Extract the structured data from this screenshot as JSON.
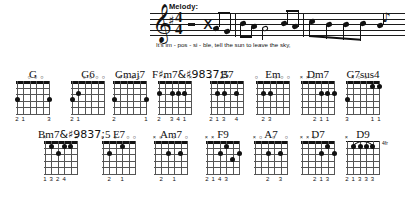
{
  "melody": {
    "label": "Melody:",
    "clef": "treble-clef",
    "key_signature": "one sharp (G major)",
    "time_signature": {
      "top": "4",
      "bottom": "4"
    },
    "lyrics": "It's im - pos - si - ble,   tell the  sun  to leave the sky,",
    "lyric_syllables": [
      "It's",
      "im",
      "-",
      "pos",
      "-",
      "si",
      "-",
      "ble,",
      "tell",
      "the",
      "sun",
      "to",
      "leave",
      "the",
      "sky,"
    ]
  },
  "chords": {
    "rows": [
      [
        {
          "name": "G",
          "markers": [
            "",
            "",
            "o",
            "o",
            "o",
            ""
          ],
          "fingers": [
            "2",
            "1",
            "",
            "",
            "",
            "3"
          ],
          "dots": [
            {
              "s": 0,
              "f": 2
            },
            {
              "s": 5,
              "f": 2
            }
          ]
        },
        {
          "name": "G6",
          "markers": [
            "",
            "",
            "o",
            "o",
            "o",
            "o"
          ],
          "fingers": [
            "2",
            "1",
            "",
            "",
            "",
            ""
          ],
          "dots": [
            {
              "s": 0,
              "f": 2
            },
            {
              "s": 1,
              "f": 1
            }
          ]
        },
        {
          "name": "Gmaj7",
          "markers": [
            "",
            "x",
            "o",
            "o",
            "o",
            ""
          ],
          "fingers": [
            "2",
            "",
            "",
            "",
            "",
            "1"
          ],
          "dots": [
            {
              "s": 0,
              "f": 2
            },
            {
              "s": 5,
              "f": 2
            }
          ]
        },
        {
          "name": "F#m7b5",
          "markers": [
            "",
            "x",
            "",
            "",
            "",
            "x"
          ],
          "fingers": [
            "2",
            "",
            "3",
            "4",
            "1",
            ""
          ],
          "dots": [
            {
              "s": 0,
              "f": 1
            },
            {
              "s": 2,
              "f": 1
            },
            {
              "s": 3,
              "f": 1
            },
            {
              "s": 4,
              "f": 1
            }
          ]
        },
        {
          "name": "B7",
          "markers": [
            "x",
            "",
            "o",
            "",
            "",
            ""
          ],
          "fingers": [
            "2",
            "1",
            "3",
            "",
            "4",
            ""
          ],
          "dots": [
            {
              "s": 1,
              "f": 1
            },
            {
              "s": 2,
              "f": 1
            },
            {
              "s": 4,
              "f": 1
            }
          ]
        },
        {
          "name": "Em",
          "markers": [
            "o",
            "",
            "",
            "o",
            "o",
            "o"
          ],
          "fingers": [
            "",
            "2",
            "3",
            "",
            "",
            ""
          ],
          "dots": [
            {
              "s": 1,
              "f": 1
            },
            {
              "s": 2,
              "f": 1
            }
          ]
        },
        {
          "name": "Dm7",
          "markers": [
            "x",
            "x",
            "o",
            "",
            "",
            ""
          ],
          "fingers": [
            "",
            "",
            "2",
            "1",
            "1",
            ""
          ],
          "dots": [
            {
              "s": 3,
              "f": 1
            },
            {
              "s": 4,
              "f": 1
            },
            {
              "s": 5,
              "f": 1
            }
          ]
        },
        {
          "name": "G7sus4",
          "markers": [
            "",
            "x",
            "o",
            "o",
            "",
            ""
          ],
          "fingers": [
            "3",
            "",
            "",
            "",
            "1",
            "1"
          ],
          "dots": [
            {
              "s": 0,
              "f": 2
            },
            {
              "s": 4,
              "f": 0
            },
            {
              "s": 5,
              "f": 0
            }
          ]
        }
      ],
      [
        {
          "name": "Bm7b5",
          "markers": [
            "x",
            "",
            "",
            "",
            "",
            "x"
          ],
          "fingers": [
            "1",
            "3",
            "2",
            "4",
            "",
            ""
          ],
          "dots": [
            {
              "s": 1,
              "f": 0
            },
            {
              "s": 2,
              "f": 1
            },
            {
              "s": 3,
              "f": 0
            },
            {
              "s": 4,
              "f": 0
            }
          ]
        },
        {
          "name": "E7",
          "markers": [
            "o",
            "",
            "o",
            "",
            "o",
            "o"
          ],
          "fingers": [
            "",
            "2",
            "",
            "1",
            "",
            ""
          ],
          "dots": [
            {
              "s": 1,
              "f": 1
            },
            {
              "s": 3,
              "f": 0
            }
          ]
        },
        {
          "name": "Am7",
          "markers": [
            "x",
            "o",
            "",
            "o",
            "",
            "o"
          ],
          "fingers": [
            "",
            "2",
            "",
            "1",
            "",
            ""
          ],
          "dots": [
            {
              "s": 2,
              "f": 1
            },
            {
              "s": 4,
              "f": 1
            }
          ]
        },
        {
          "name": "F9",
          "markers": [
            "x",
            "x",
            "",
            "",
            "",
            ""
          ],
          "fingers": [
            "2",
            "1",
            "4",
            "3",
            "",
            ""
          ],
          "dots": [
            {
              "s": 2,
              "f": 1
            },
            {
              "s": 3,
              "f": 0
            },
            {
              "s": 4,
              "f": 2
            },
            {
              "s": 5,
              "f": 1
            }
          ]
        },
        {
          "name": "A7",
          "markers": [
            "x",
            "o",
            "",
            "o",
            "",
            "o"
          ],
          "fingers": [
            "",
            "",
            "2",
            "",
            "3",
            ""
          ],
          "dots": [
            {
              "s": 2,
              "f": 1
            },
            {
              "s": 4,
              "f": 1
            }
          ]
        },
        {
          "name": "D7",
          "markers": [
            "x",
            "x",
            "o",
            "",
            "",
            ""
          ],
          "fingers": [
            "",
            "",
            "2",
            "1",
            "3",
            ""
          ],
          "dots": [
            {
              "s": 3,
              "f": 1
            },
            {
              "s": 4,
              "f": 0
            },
            {
              "s": 5,
              "f": 1
            }
          ]
        },
        {
          "name": "D9",
          "markers": [
            "x",
            "",
            "",
            "",
            "",
            ""
          ],
          "fret_label": "4fr",
          "barre": true,
          "fingers": [
            "2",
            "1",
            "3",
            "3",
            "3",
            ""
          ],
          "dots": [
            {
              "s": 1,
              "f": 0
            },
            {
              "s": 2,
              "f": 0
            },
            {
              "s": 3,
              "f": 0
            },
            {
              "s": 4,
              "f": 0
            }
          ]
        }
      ]
    ]
  }
}
